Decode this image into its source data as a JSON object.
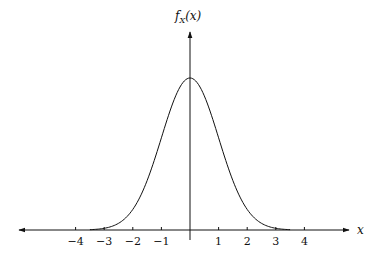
{
  "chart_data": {
    "type": "line",
    "title": "",
    "xlabel": "x",
    "ylabel": "f_X(x)",
    "ylabel_parts": {
      "base": "f",
      "sub": "X",
      "arg": "(x)"
    },
    "x_ticks": [
      -4,
      -3,
      -2,
      -1,
      1,
      2,
      3,
      4
    ],
    "x_tick_labels": [
      "−4",
      "−3",
      "−2",
      "−1",
      "1",
      "2",
      "3",
      "4"
    ],
    "xlim": [
      -6.0,
      5.6
    ],
    "y_ticks": [],
    "grid": false,
    "legend": null,
    "series": [
      {
        "name": "standard normal pdf",
        "function": "exp(-x^2/2)/sqrt(2*pi)",
        "x": [
          -3.5,
          -3,
          -2.5,
          -2,
          -1.5,
          -1,
          -0.5,
          0,
          0.5,
          1,
          1.5,
          2,
          2.5,
          3,
          3.5
        ],
        "values": [
          0.0009,
          0.0044,
          0.0175,
          0.054,
          0.1295,
          0.242,
          0.3521,
          0.3989,
          0.3521,
          0.242,
          0.1295,
          0.054,
          0.0175,
          0.0044,
          0.0009
        ]
      }
    ]
  }
}
